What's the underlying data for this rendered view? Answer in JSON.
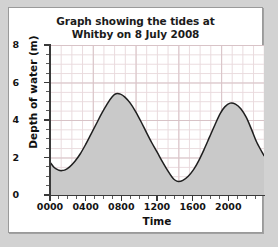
{
  "figure": {
    "title_line1": "Graph showing the tides at",
    "title_line2": "Whitby on 8 July 2008",
    "panel_background": "#ffffff",
    "outer_background": "#d2d2d2"
  },
  "chart_data": {
    "type": "line",
    "title": "Graph showing the tides at Whitby on 8 July 2008",
    "xlabel": "Time",
    "ylabel": "Depth of water (m)",
    "xlim": [
      0,
      2400
    ],
    "ylim": [
      0,
      8
    ],
    "grid": true,
    "grid_minor": true,
    "legend": "none",
    "fill_under_curve": true,
    "fill_color": "#c9c9c9",
    "line_color": "#1f1f1f",
    "x_tick_labels": [
      "0000",
      "0400",
      "0800",
      "1200",
      "1600",
      "2000"
    ],
    "x_tick_values": [
      0,
      400,
      800,
      1200,
      1600,
      2000
    ],
    "x_major_step": 400,
    "x_minor_step": 100,
    "y_tick_labels": [
      "0",
      "2",
      "4",
      "6",
      "8"
    ],
    "y_tick_values": [
      0,
      2,
      4,
      6,
      8
    ],
    "y_major_step": 2,
    "y_minor_step": 0.5,
    "annotations": [
      {
        "label": "low tide",
        "x": 130,
        "y": 1.3
      },
      {
        "label": "high tide",
        "x": 740,
        "y": 5.4
      },
      {
        "label": "low tide",
        "x": 1400,
        "y": 0.7
      },
      {
        "label": "high tide",
        "x": 2020,
        "y": 4.9
      }
    ],
    "x": [
      0,
      50,
      100,
      130,
      170,
      220,
      280,
      340,
      400,
      460,
      520,
      580,
      640,
      700,
      740,
      790,
      840,
      900,
      960,
      1020,
      1080,
      1140,
      1200,
      1260,
      1320,
      1370,
      1400,
      1440,
      1490,
      1550,
      1610,
      1670,
      1730,
      1790,
      1850,
      1910,
      1960,
      2020,
      2080,
      2140,
      2200,
      2260,
      2320,
      2400
    ],
    "y": [
      1.75,
      1.45,
      1.32,
      1.3,
      1.34,
      1.5,
      1.8,
      2.2,
      2.7,
      3.25,
      3.8,
      4.35,
      4.85,
      5.25,
      5.4,
      5.38,
      5.22,
      4.9,
      4.45,
      3.92,
      3.35,
      2.8,
      2.3,
      1.78,
      1.3,
      0.95,
      0.8,
      0.72,
      0.78,
      1.0,
      1.35,
      1.85,
      2.45,
      3.1,
      3.75,
      4.35,
      4.7,
      4.9,
      4.85,
      4.6,
      4.15,
      3.5,
      2.8,
      2.1
    ]
  }
}
